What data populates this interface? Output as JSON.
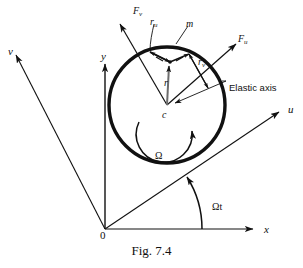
{
  "figure": {
    "caption": "Fig. 7.4",
    "background_color": "#ffffff",
    "ink_color": "#111111"
  },
  "axes": [
    {
      "name": "x-axis",
      "label": "x",
      "label_x": 264,
      "label_y": 224
    },
    {
      "name": "y-axis",
      "label": "y",
      "label_x": 101,
      "label_y": 51
    },
    {
      "name": "u-axis",
      "label": "u",
      "label_x": 288,
      "label_y": 104
    },
    {
      "name": "v-axis",
      "label": "v",
      "label_x": 8,
      "label_y": 46
    }
  ],
  "forces": [
    {
      "name": "force-v",
      "base": "F",
      "sub": "v",
      "label_x": 133,
      "label_y": 6
    },
    {
      "name": "force-u",
      "base": "F",
      "sub": "u",
      "label_x": 238,
      "label_y": 34
    }
  ],
  "vectors": [
    {
      "name": "radius-r",
      "base": "r",
      "sub": "",
      "label_x": 164,
      "label_y": 78
    },
    {
      "name": "radius-ru",
      "base": "r",
      "sub": "u",
      "label_x": 150,
      "label_y": 17
    },
    {
      "name": "radius-rv",
      "base": "r",
      "sub": "v",
      "label_x": 198,
      "label_y": 57
    }
  ],
  "points": [
    {
      "name": "mass-label",
      "label": "m",
      "label_x": 186,
      "label_y": 19
    },
    {
      "name": "center-label",
      "label": "c",
      "label_x": 162,
      "label_y": 110
    },
    {
      "name": "origin-label",
      "label": "0",
      "label_x": 100,
      "label_y": 230
    }
  ],
  "annotations": [
    {
      "name": "elastic-axis-label",
      "label": "Elastic axis",
      "label_x": 229,
      "label_y": 83
    },
    {
      "name": "spin-rate-label",
      "label": "Ω",
      "label_x": 155,
      "label_y": 151
    },
    {
      "name": "spin-angle-label",
      "label": "Ωt",
      "label_x": 212,
      "label_y": 202
    }
  ],
  "geometry": {
    "circle_center_x": 167,
    "circle_center_y": 105,
    "circle_radius": 58,
    "mass_point_x": 170,
    "mass_point_y": 62,
    "origin_x": 105,
    "origin_y": 229
  }
}
